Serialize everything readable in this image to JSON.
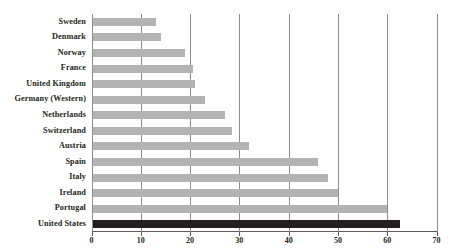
{
  "chart_data": {
    "type": "bar",
    "orientation": "horizontal",
    "title": "",
    "xlabel": "",
    "ylabel": "",
    "xlim": [
      0,
      70
    ],
    "xticks": [
      0,
      10,
      20,
      30,
      40,
      50,
      60,
      70
    ],
    "grid": true,
    "legend": "none",
    "categories": [
      "Sweden",
      "Denmark",
      "Norway",
      "France",
      "United Kingdom",
      "Germany (Western)",
      "Netherlands",
      "Switzerland",
      "Austria",
      "Spain",
      "Italy",
      "Ireland",
      "Portugal",
      "United States"
    ],
    "values": [
      13,
      14,
      19,
      20.5,
      21,
      23,
      27,
      28.5,
      32,
      46,
      48,
      50,
      60,
      62.5
    ],
    "bar_colors": [
      "#b3b3b3",
      "#b3b3b3",
      "#b3b3b3",
      "#b3b3b3",
      "#b3b3b3",
      "#b3b3b3",
      "#b3b3b3",
      "#b3b3b3",
      "#b3b3b3",
      "#b3b3b3",
      "#b3b3b3",
      "#b3b3b3",
      "#b3b3b3",
      "#231f20"
    ],
    "highlight_category": "United States",
    "colors": {
      "bar": "#b3b3b3",
      "highlight_bar": "#231f20",
      "gridline": "#8d8d8d",
      "axis": "#5a5a5a",
      "text": "#231f20",
      "background": "#ffffff"
    }
  }
}
